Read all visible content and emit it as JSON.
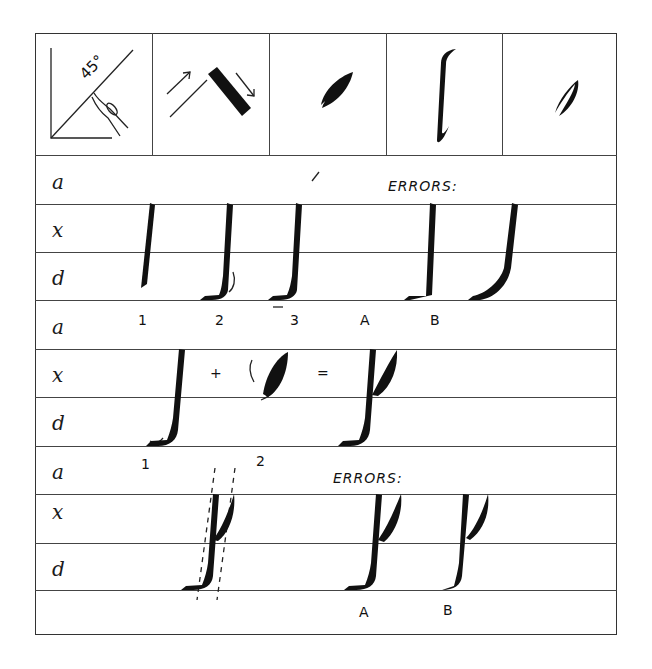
{
  "header_cells": [
    {
      "name": "pen-angle-diagram",
      "label": "45°"
    },
    {
      "name": "stroke-direction-diagram"
    },
    {
      "name": "bowl-shape-1"
    },
    {
      "name": "stem-shape"
    },
    {
      "name": "bowl-shape-2"
    }
  ],
  "guide_letters": {
    "section1": [
      "a",
      "x",
      "d"
    ],
    "section2": [
      "a",
      "x",
      "d"
    ],
    "section3": [
      "a",
      "x",
      "d"
    ]
  },
  "section1": {
    "errors_label": "ERRORS:",
    "step_labels": [
      "1",
      "2",
      "3"
    ],
    "error_labels": [
      "A",
      "B"
    ]
  },
  "section2": {
    "operators": [
      "+",
      "="
    ],
    "step_labels": [
      "1",
      "2"
    ]
  },
  "section3": {
    "errors_label": "ERRORS:",
    "error_labels": [
      "A",
      "B"
    ]
  },
  "colors": {
    "ink": "#111111",
    "rule": "#444444",
    "paper": "#ffffff"
  }
}
